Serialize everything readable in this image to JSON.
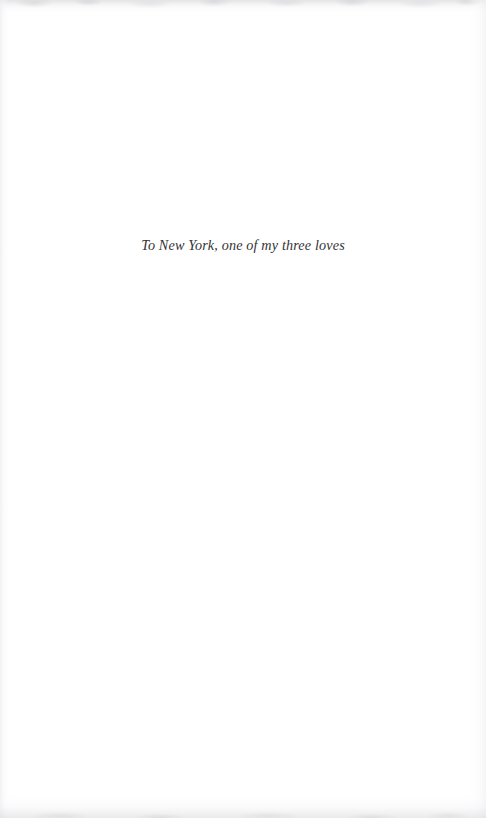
{
  "page": {
    "kind": "book-dedication-page",
    "background_color": "#ffffff",
    "width": 486,
    "height": 818
  },
  "dedication": {
    "text": "To New York, one of my three loves",
    "style": "italic-serif",
    "color": "#333336",
    "alignment": "center"
  },
  "artifacts": {
    "top_edge": "scan-shadow-top",
    "bottom_edge": "scan-shadow-bottom",
    "left_edge": "scan-tint-left",
    "right_edge": "scan-tint-right"
  }
}
